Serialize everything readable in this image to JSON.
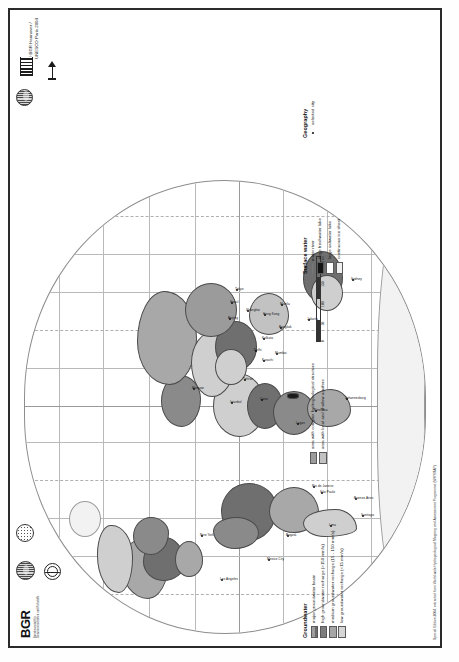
{
  "poster": {
    "title": "Groundwater Resources of the World",
    "copyright_line1": "© BGR Hannover /",
    "copyright_line2": "UNESCO Paris 2004",
    "source_note": "Special Edition 2004, extracted from World-wide Hydrogeological Mapping and Assessment Programme (WHYMAP)"
  },
  "logos": {
    "bgr_word": "BGR",
    "bgr_sub": "Bundesanstalt für Geowissenschaften und Rohstoffe",
    "unesco_name": "unesco-temple-logo",
    "whymap_name": "whymap-globe-logo",
    "igrac_name": "igrac-disc-logo",
    "iah_name": "iah-dotted-logo",
    "arrow_name": "north-arrow-logo"
  },
  "legend": {
    "groundwater": {
      "title": "Groundwater",
      "items": [
        {
          "label": "major groundwater basin",
          "swatch": "sw-basin"
        },
        {
          "label": "high groundwater recharge (>150 mm/a)",
          "swatch": "sw-high"
        },
        {
          "label": "medium groundwater recharge (15 - 150 mm/a)",
          "swatch": "sw-med"
        },
        {
          "label": "low groundwater recharge (<15 mm/a)",
          "swatch": "sw-low"
        }
      ]
    },
    "structure": {
      "items": [
        {
          "label": "area with complex hydrogeological structure",
          "swatch": "sw-complex"
        },
        {
          "label": "area with local and shallow aquifers",
          "swatch": "sw-local"
        }
      ]
    },
    "surface_water": {
      "title": "Surface water",
      "items": [
        {
          "label": "major river",
          "swatch": "sw-line"
        },
        {
          "label": "large freshwater lake",
          "swatch": "sw-fresh"
        },
        {
          "label": "large saltwater lake",
          "swatch": "sw-salt"
        },
        {
          "label": "continuous ice sheet",
          "swatch": "sw-ice"
        }
      ]
    },
    "geography": {
      "title": "Geography",
      "items": [
        {
          "label": "selected city",
          "swatch": "sw-dot"
        }
      ]
    }
  },
  "scalebar": {
    "ticks": [
      "0",
      "50",
      "100",
      "150",
      "200"
    ],
    "unit": "km"
  },
  "map": {
    "cities": [
      {
        "name": "Los Angeles",
        "x": 52,
        "y": 196
      },
      {
        "name": "Mexico City",
        "x": 72,
        "y": 243
      },
      {
        "name": "New York",
        "x": 96,
        "y": 176
      },
      {
        "name": "Bogotá",
        "x": 96,
        "y": 262
      },
      {
        "name": "Lima",
        "x": 106,
        "y": 305
      },
      {
        "name": "Santiago",
        "x": 116,
        "y": 337
      },
      {
        "name": "Buenos Aires",
        "x": 133,
        "y": 330
      },
      {
        "name": "São Paulo",
        "x": 139,
        "y": 296
      },
      {
        "name": "Rio de Janeiro",
        "x": 145,
        "y": 288
      },
      {
        "name": "Lagos",
        "x": 208,
        "y": 272
      },
      {
        "name": "Kinshasa",
        "x": 221,
        "y": 290
      },
      {
        "name": "Johannesburg",
        "x": 233,
        "y": 321
      },
      {
        "name": "Cairo",
        "x": 232,
        "y": 236
      },
      {
        "name": "Istanbul",
        "x": 229,
        "y": 206
      },
      {
        "name": "Moscow",
        "x": 243,
        "y": 168
      },
      {
        "name": "Tehran",
        "x": 252,
        "y": 219
      },
      {
        "name": "Karachi",
        "x": 271,
        "y": 238
      },
      {
        "name": "Delhi",
        "x": 281,
        "y": 230
      },
      {
        "name": "Mumbai",
        "x": 278,
        "y": 251
      },
      {
        "name": "Kolkata",
        "x": 293,
        "y": 238
      },
      {
        "name": "Bangkok",
        "x": 304,
        "y": 255
      },
      {
        "name": "Jakarta",
        "x": 312,
        "y": 283
      },
      {
        "name": "Beijing",
        "x": 313,
        "y": 204
      },
      {
        "name": "Shanghai",
        "x": 321,
        "y": 222
      },
      {
        "name": "Hong Kong",
        "x": 317,
        "y": 239
      },
      {
        "name": "Seoul",
        "x": 329,
        "y": 206
      },
      {
        "name": "Tokyo",
        "x": 342,
        "y": 211
      },
      {
        "name": "Manila",
        "x": 327,
        "y": 256
      },
      {
        "name": "Sydney",
        "x": 352,
        "y": 327
      }
    ]
  }
}
